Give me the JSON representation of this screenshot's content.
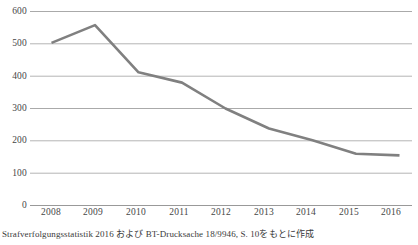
{
  "chart_data": {
    "type": "line",
    "title": "",
    "subtitle": "",
    "xlabel": "",
    "ylabel": "",
    "categories": [
      "2008",
      "2009",
      "2010",
      "2011",
      "2012",
      "2013",
      "2014",
      "2015",
      "2016"
    ],
    "series": [
      {
        "name": "",
        "values": [
          503,
          558,
          412,
          380,
          300,
          238,
          202,
          160,
          155
        ]
      }
    ],
    "ylim": [
      0,
      600
    ],
    "yticks": [
      0,
      100,
      200,
      300,
      400,
      500,
      600
    ],
    "ytick_labels": [
      "0",
      "100",
      "200",
      "300",
      "400",
      "500",
      "600"
    ],
    "grid": "horizontal",
    "legend": "none",
    "line_color": "#808080",
    "gridline_color": "#b0b0b0",
    "axis_color": "#8c8c8c",
    "background_color": "#ffffff"
  },
  "caption": {
    "text": "Strafverfolgungsstatistik 2016 および BT-Drucksache 18/9946, S. 10をもとに作成"
  }
}
